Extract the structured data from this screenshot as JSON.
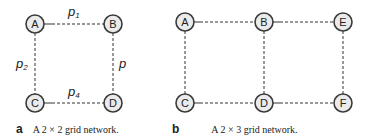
{
  "panels": [
    {
      "letter": "a",
      "caption": "A 2 × 2 grid network.",
      "nodes": [
        "A",
        "B",
        "C",
        "D"
      ],
      "edge_labels": {
        "top": "p",
        "top_sub": "1",
        "left": "p",
        "left_sub": "2",
        "right": "p",
        "bottom": "p",
        "bottom_sub": "4"
      }
    },
    {
      "letter": "b",
      "caption": "A 2 × 3 grid network.",
      "nodes": [
        "A",
        "B",
        "E",
        "C",
        "D",
        "F"
      ]
    }
  ],
  "colors": {
    "node_fill": "#ebebeb",
    "node_stroke": "#3a3a3a",
    "edge": "#333333"
  }
}
